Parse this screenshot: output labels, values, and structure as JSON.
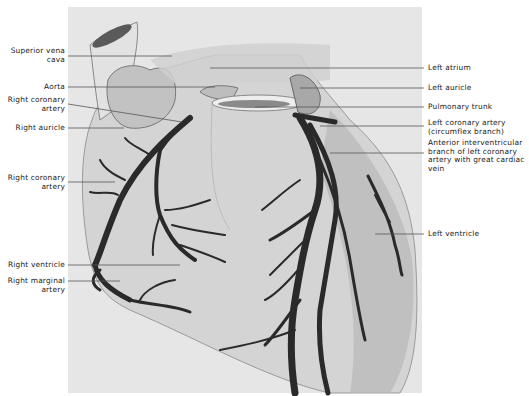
{
  "figure": {
    "left_labels": [
      {
        "id": "superior-vena-cava",
        "text": "Superior vena\ncava",
        "x": 5,
        "y": 47,
        "w": 60,
        "line_y": 56,
        "line_x2": 172
      },
      {
        "id": "aorta",
        "text": "Aorta",
        "x": 5,
        "y": 83,
        "w": 60,
        "line_y": 87,
        "line_x2": 215
      },
      {
        "id": "right-coronary-artery-top",
        "text": "Right coronary\nartery",
        "x": 5,
        "y": 96,
        "w": 60,
        "line_y": 104,
        "line_x2": 182
      },
      {
        "id": "right-auricle",
        "text": "Right auricle",
        "x": 5,
        "y": 124,
        "w": 60,
        "line_y": 128,
        "line_x2": 124
      },
      {
        "id": "right-coronary-artery-mid",
        "text": "Right coronary\nartery",
        "x": 5,
        "y": 174,
        "w": 60,
        "line_y": 182,
        "line_x2": 115
      },
      {
        "id": "right-ventricle",
        "text": "Right ventricle",
        "x": 5,
        "y": 261,
        "w": 60,
        "line_y": 265,
        "line_x2": 180
      },
      {
        "id": "right-marginal-artery",
        "text": "Right marginal\nartery",
        "x": 5,
        "y": 277,
        "w": 60,
        "line_y": 281,
        "line_x2": 120
      }
    ],
    "right_labels": [
      {
        "id": "left-atrium",
        "text": "Left atrium",
        "x": 428,
        "y": 64,
        "line_y": 68,
        "line_x1": 210
      },
      {
        "id": "left-auricle",
        "text": "Left auricle",
        "x": 428,
        "y": 84,
        "line_y": 88,
        "line_x1": 300
      },
      {
        "id": "pulmonary-trunk",
        "text": "Pulmonary trunk",
        "x": 428,
        "y": 103,
        "line_y": 107,
        "line_x1": 255
      },
      {
        "id": "left-coronary-artery-circumflex",
        "text": "Left coronary artery\n(circumflex branch)",
        "x": 428,
        "y": 119,
        "line_y": 126,
        "line_x1": 320
      },
      {
        "id": "anterior-interventricular-branch",
        "text": "Anterior interventricular\nbranch of left coronary\nartery with great cardiac\nvein",
        "x": 428,
        "y": 139,
        "line_y": 153,
        "line_x1": 330
      },
      {
        "id": "left-ventricle",
        "text": "Left ventricle",
        "x": 428,
        "y": 232,
        "line_y": 234,
        "line_x1": 375
      }
    ]
  },
  "colors": {
    "background": "#ffffff",
    "panel": "#e6e6e6",
    "heart_fill": "#d2d2d2",
    "vessel": "#2a2a2a",
    "leader_line": "#555555",
    "text": "#222222"
  }
}
